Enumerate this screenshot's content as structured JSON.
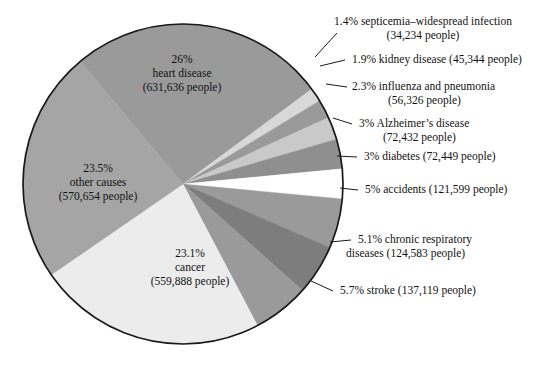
{
  "chart_data": {
    "type": "pie",
    "title": "",
    "subtitle": "",
    "xlabel": "",
    "ylabel": "",
    "legend_position": "none",
    "grid": false,
    "units": "people",
    "center": {
      "x": 183,
      "y": 184
    },
    "radius": 160,
    "start_angle_deg": -130,
    "direction": "clockwise",
    "categories": [
      "heart disease",
      "septicemia-widespread infection",
      "kidney disease",
      "influenza and pneumonia",
      "Alzheimer's disease",
      "diabetes",
      "accidents",
      "chronic respiratory diseases",
      "stroke",
      "cancer",
      "other causes"
    ],
    "values": [
      26,
      1.4,
      1.9,
      2.3,
      3,
      3,
      5,
      5.1,
      5.7,
      23.1,
      23.5
    ],
    "counts": [
      631636,
      34234,
      45344,
      56326,
      72432,
      72449,
      121599,
      124583,
      137119,
      559888,
      570654
    ],
    "slices": [
      {
        "name": "heart disease",
        "percent_label": "26%",
        "count_label": "631,636 people",
        "color": "#9a9a9a",
        "value": 26
      },
      {
        "name": "septicemia-widespread infection",
        "percent_label": "1.4%",
        "count_label": "34,234 people",
        "color": "#d8d8d8",
        "value": 1.4
      },
      {
        "name": "kidney disease",
        "percent_label": "1.9%",
        "count_label": "45,344 people",
        "color": "#9a9a9a",
        "value": 1.9
      },
      {
        "name": "influenza and pneumonia",
        "percent_label": "2.3%",
        "count_label": "56,326 people",
        "color": "#c9c9c9",
        "value": 2.3
      },
      {
        "name": "Alzheimer's disease",
        "percent_label": "3%",
        "count_label": "72,432 people",
        "color": "#8f8f8f",
        "value": 3
      },
      {
        "name": "diabetes",
        "percent_label": "3%",
        "count_label": "72,449 people",
        "color": "#ffffff",
        "value": 3
      },
      {
        "name": "accidents",
        "percent_label": "5%",
        "count_label": "121,599 people",
        "color": "#9a9a9a",
        "value": 5
      },
      {
        "name": "chronic respiratory diseases",
        "percent_label": "5.1%",
        "count_label": "124,583 people",
        "color": "#7d7d7d",
        "value": 5.1
      },
      {
        "name": "stroke",
        "percent_label": "5.7%",
        "count_label": "137,119 people",
        "color": "#9a9a9a",
        "value": 5.7
      },
      {
        "name": "cancer",
        "percent_label": "23.1%",
        "count_label": "559,888 people",
        "color": "#ececec",
        "value": 23.1
      },
      {
        "name": "other causes",
        "percent_label": "23.5%",
        "count_label": "570,654 people",
        "color": "#a5a5a5",
        "value": 23.1
      }
    ]
  },
  "inner_labels": {
    "heart_disease": {
      "line1": "26%",
      "line2": "heart disease",
      "line3": "(631,636 people)"
    },
    "other_causes": {
      "line1": "23.5%",
      "line2": "other causes",
      "line3": "(570,654 people)"
    },
    "cancer": {
      "line1": "23.1%",
      "line2": "cancer",
      "line3": "(559,888 people)"
    }
  },
  "callouts": [
    {
      "id": "septicemia",
      "line1": "1.4% septicemia–widespread infection",
      "line2": "(34,234 people)"
    },
    {
      "id": "kidney-disease",
      "line1": "1.9% kidney disease (45,344 people)",
      "line2": ""
    },
    {
      "id": "influenza-pneumonia",
      "line1": "2.3% influenza and pneumonia",
      "line2": "(56,326 people)"
    },
    {
      "id": "alzheimers-disease",
      "line1": "3% Alzheimer’s disease",
      "line2": "(72,432 people)"
    },
    {
      "id": "diabetes",
      "line1": "3% diabetes (72,449 people)",
      "line2": ""
    },
    {
      "id": "accidents",
      "line1": "5% accidents (121,599 people)",
      "line2": ""
    },
    {
      "id": "chronic-respiratory",
      "line1": "5.1% chronic respiratory",
      "line2": "diseases (124,583 people)"
    },
    {
      "id": "stroke",
      "line1": "5.7% stroke (137,119 people)",
      "line2": ""
    }
  ],
  "colors": {
    "outline": "#1a1a1a",
    "background": "#ffffff",
    "text": "#111111"
  }
}
